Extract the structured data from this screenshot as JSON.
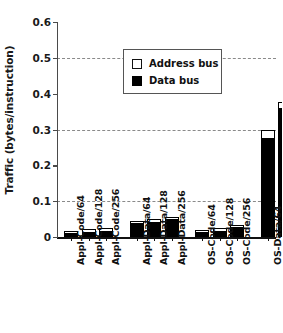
{
  "chart_data": {
    "type": "bar",
    "stacked": true,
    "title": "",
    "xlabel": "",
    "ylabel": "Traffic (bytes/instruction)",
    "ylim": [
      0,
      0.6
    ],
    "ytick_labels": [
      "0",
      "0.1",
      "0.2",
      "0.3",
      "0.4",
      "0.5",
      "0.6"
    ],
    "ytick_values": [
      0,
      0.1,
      0.2,
      0.3,
      0.4,
      0.5,
      0.6
    ],
    "gridlines_at": [
      0.1,
      0.3,
      0.5
    ],
    "grid": "dashed horizontal at 0.1, 0.3, 0.5",
    "legend_position": "upper left inside plot",
    "categories": [
      "Appl-Code/64",
      "Appl-Code/128",
      "Appl-Code/256",
      "Appl-Data/64",
      "Appl-Data/128",
      "Appl-Data/256",
      "OS-Code/64",
      "OS-Code/128",
      "OS-Code/256",
      "OS-Data/64",
      "OS-Data/128",
      "OS-Data/256"
    ],
    "group_gaps_after": [
      2,
      5,
      8
    ],
    "series": [
      {
        "name": "Data bus",
        "color": "#000000",
        "values": [
          0.012,
          0.015,
          0.018,
          0.039,
          0.043,
          0.05,
          0.013,
          0.018,
          0.027,
          0.275,
          0.36,
          0.535
        ]
      },
      {
        "name": "Address bus",
        "color": "#ffffff",
        "values": [
          0.003,
          0.003,
          0.003,
          0.004,
          0.004,
          0.004,
          0.003,
          0.003,
          0.003,
          0.025,
          0.018,
          0.015
        ]
      }
    ],
    "totals": [
      0.015,
      0.018,
      0.021,
      0.043,
      0.047,
      0.054,
      0.016,
      0.021,
      0.03,
      0.3,
      0.378,
      0.55
    ]
  },
  "legend": {
    "entries": [
      {
        "label": "Address bus",
        "swatch": "white-square-outlined"
      },
      {
        "label": "Data bus",
        "swatch": "black-filled-square"
      }
    ]
  }
}
